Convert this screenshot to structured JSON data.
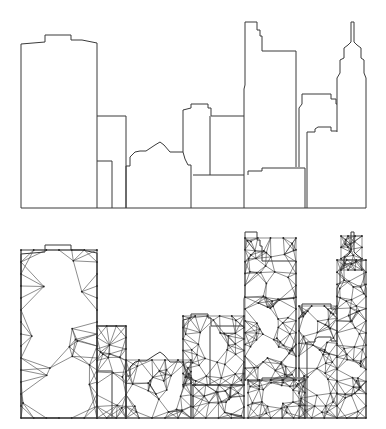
{
  "figure": {
    "panels": [
      {
        "id": "outline",
        "label": "Skyline outline"
      },
      {
        "id": "mesh",
        "label": "Triangulated skyline mesh"
      }
    ],
    "colors": {
      "line": "#3a3a3a",
      "background": "#ffffff"
    }
  },
  "outline_paths": [
    "M21,208 L21,44 L45,42 L45,35 L71,35 L71,40 L82,40 L97,43 L97,208",
    "M97,116 L126,116 L126,208",
    "M97,161 L112,161 L112,208",
    "M126,208 L126,166 L130,166 L130,157 L135,152 L140,151 L146,151 L155,145 L160,142 L164,145 L170,152 L183,152 L185,159 L188,165 L191,165 L191,208",
    "M183,152 L183,110 L191,108 L191,104 L208,104 L208,108 L211,108 L211,116 L244,116",
    "M210,116 L210,175",
    "M193,175 L244,175 L244,208",
    "M244,175 L244,89 L245,85 L245,22 L257,22 L257,30 L260,30 L260,36 L262,36 L262,51 L296,51 L296,167",
    "M248,175 L248,171 L262,171 L262,168 L305,168 L305,208",
    "M299,167 L299,108 L302,104 L302,94 L331,94 L331,99 L336,99 L336,104 L337,104",
    "M307,208 L307,132 L315,132 L315,129 L318,127 L331,127 L331,131 L337,131",
    "M337,132 L337,78 L340,73 L340,60 L344,58 L344,48 L348,45 L351,42 L351,22 L354,22 L354,42 L357,45 L361,48 L361,58 L364,60 L364,73 L366,78 L366,208",
    "M21,208 L366,208"
  ],
  "mesh": {
    "offset_y": -5,
    "boundary_note": "Same silhouette as outline, triangulated with interior nodes"
  }
}
